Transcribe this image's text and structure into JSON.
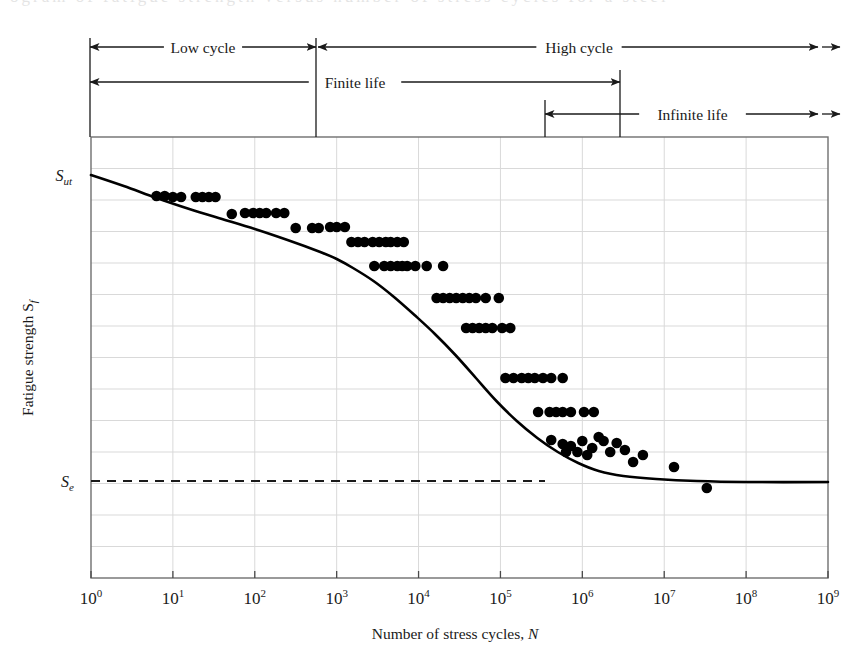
{
  "figure": {
    "partial_top_text": "ogram of fatigue strength versus number of stress cycles for a steel",
    "background": "#ffffff",
    "ink_color": "#1a1a1a",
    "grid_color": "#d9d9d9"
  },
  "annotations": {
    "rows": [
      {
        "id": "low-cycle",
        "label": "Low cycle",
        "x1": 90,
        "x2": 316,
        "y": 47,
        "left_arrow": true,
        "right_arrow": true,
        "double_right": false
      },
      {
        "id": "high-cycle",
        "label": "High cycle",
        "x1": 318,
        "x2": 840,
        "y": 47,
        "left_arrow": true,
        "right_arrow": true,
        "double_right": true
      },
      {
        "id": "finite-life",
        "label": "Finite life",
        "x1": 90,
        "x2": 620,
        "y": 82,
        "left_arrow": true,
        "right_arrow": true,
        "double_right": false
      },
      {
        "id": "infinite-life",
        "label": "Infinite life",
        "x1": 545,
        "x2": 840,
        "y": 114,
        "left_arrow": true,
        "right_arrow": true,
        "double_right": true
      }
    ],
    "verticals": [
      {
        "id": "tick-left-edge",
        "x": 90,
        "y1": 38,
        "y2": 137
      },
      {
        "id": "tick-1e3",
        "x": 316,
        "y1": 38,
        "y2": 137
      },
      {
        "id": "tick-1e7-finite",
        "x": 620,
        "y1": 70,
        "y2": 137
      },
      {
        "id": "tick-1e6-infinite",
        "x": 545,
        "y1": 100,
        "y2": 137
      }
    ]
  },
  "axes": {
    "x_title": "Number of stress cycles, N",
    "x_title_italic_tail": "N",
    "y_title": "Fatigue strength S",
    "y_title_sub": "f",
    "x_ticks": [
      {
        "base": "10",
        "exp": "0",
        "value": 1
      },
      {
        "base": "10",
        "exp": "1",
        "value": 10
      },
      {
        "base": "10",
        "exp": "2",
        "value": 100
      },
      {
        "base": "10",
        "exp": "3",
        "value": 1000
      },
      {
        "base": "10",
        "exp": "4",
        "value": 10000
      },
      {
        "base": "10",
        "exp": "5",
        "value": 100000
      },
      {
        "base": "10",
        "exp": "6",
        "value": 1000000
      },
      {
        "base": "10",
        "exp": "7",
        "value": 10000000
      },
      {
        "base": "10",
        "exp": "8",
        "value": 100000000
      },
      {
        "base": "10",
        "exp": "9",
        "value": 1000000000
      }
    ],
    "y_markers": [
      {
        "id": "sut",
        "base": "S",
        "sub": "ut",
        "y": 175,
        "label_x": 72
      },
      {
        "id": "se",
        "base": "S",
        "sub": "e",
        "y": 481,
        "label_x": 74
      }
    ],
    "plot_box": {
      "left": 91,
      "top": 137,
      "right": 828,
      "bottom": 578
    },
    "grid_horizontal_count": 13,
    "grid_vertical_decades": 9
  },
  "reference_lines": {
    "endurance_limit": {
      "id": "se-dashed-line",
      "y": 481,
      "x1": 91,
      "x2": 545,
      "dash": "9 7"
    }
  },
  "chart_data": {
    "type": "scatter",
    "title": "",
    "xlabel": "Number of stress cycles, N",
    "ylabel": "Fatigue strength S_f",
    "xscale": "log",
    "xlim": [
      1,
      1000000000
    ],
    "ylim_labels": [
      "S_e",
      "S_ut"
    ],
    "grid": true,
    "legend": "none",
    "series": [
      {
        "name": "S-N curve (fitted)",
        "type": "line",
        "comment": "Fatigue strength curve; knee near 1e6 cycles flattening to endurance limit S_e",
        "points_log10N_vs_pixelY": [
          [
            0.0,
            175
          ],
          [
            0.4,
            186
          ],
          [
            0.8,
            198
          ],
          [
            1.2,
            209
          ],
          [
            1.6,
            219
          ],
          [
            2.0,
            229
          ],
          [
            2.4,
            240
          ],
          [
            2.8,
            252
          ],
          [
            3.0,
            259
          ],
          [
            3.2,
            268
          ],
          [
            3.45,
            281
          ],
          [
            3.7,
            297
          ],
          [
            3.95,
            315
          ],
          [
            4.2,
            334
          ],
          [
            4.45,
            355
          ],
          [
            4.7,
            378
          ],
          [
            4.95,
            401
          ],
          [
            5.2,
            421
          ],
          [
            5.45,
            438
          ],
          [
            5.7,
            452
          ],
          [
            5.95,
            463
          ],
          [
            6.2,
            471
          ],
          [
            6.5,
            476
          ],
          [
            6.9,
            479
          ],
          [
            7.4,
            481
          ],
          [
            8.0,
            482
          ],
          [
            9.0,
            482
          ]
        ]
      },
      {
        "name": "test data points",
        "type": "scatter",
        "points_log10N_vs_pixelY": [
          [
            0.8,
            196
          ],
          [
            0.9,
            196
          ],
          [
            1.0,
            197
          ],
          [
            1.1,
            197
          ],
          [
            1.28,
            197
          ],
          [
            1.36,
            197
          ],
          [
            1.44,
            197
          ],
          [
            1.52,
            197
          ],
          [
            1.72,
            214
          ],
          [
            1.88,
            213
          ],
          [
            1.98,
            213
          ],
          [
            2.06,
            213
          ],
          [
            2.14,
            213
          ],
          [
            2.26,
            213
          ],
          [
            2.36,
            213
          ],
          [
            2.5,
            228
          ],
          [
            2.7,
            228
          ],
          [
            2.78,
            228
          ],
          [
            2.92,
            227
          ],
          [
            3.0,
            227
          ],
          [
            3.1,
            227
          ],
          [
            3.18,
            242
          ],
          [
            3.26,
            242
          ],
          [
            3.34,
            242
          ],
          [
            3.44,
            242
          ],
          [
            3.52,
            242
          ],
          [
            3.6,
            242
          ],
          [
            3.66,
            242
          ],
          [
            3.74,
            242
          ],
          [
            3.82,
            242
          ],
          [
            3.46,
            266
          ],
          [
            3.58,
            266
          ],
          [
            3.66,
            266
          ],
          [
            3.74,
            266
          ],
          [
            3.8,
            266
          ],
          [
            3.86,
            266
          ],
          [
            3.96,
            266
          ],
          [
            4.1,
            266
          ],
          [
            4.3,
            266
          ],
          [
            4.22,
            298
          ],
          [
            4.3,
            298
          ],
          [
            4.38,
            298
          ],
          [
            4.46,
            298
          ],
          [
            4.54,
            298
          ],
          [
            4.62,
            298
          ],
          [
            4.7,
            298
          ],
          [
            4.82,
            298
          ],
          [
            4.98,
            298
          ],
          [
            4.58,
            328
          ],
          [
            4.66,
            328
          ],
          [
            4.74,
            328
          ],
          [
            4.82,
            328
          ],
          [
            4.9,
            328
          ],
          [
            5.02,
            328
          ],
          [
            5.12,
            328
          ],
          [
            5.06,
            378
          ],
          [
            5.16,
            378
          ],
          [
            5.26,
            378
          ],
          [
            5.34,
            378
          ],
          [
            5.42,
            378
          ],
          [
            5.52,
            378
          ],
          [
            5.62,
            378
          ],
          [
            5.76,
            378
          ],
          [
            5.46,
            412
          ],
          [
            5.6,
            412
          ],
          [
            5.68,
            412
          ],
          [
            5.76,
            412
          ],
          [
            5.86,
            412
          ],
          [
            6.02,
            412
          ],
          [
            6.14,
            412
          ],
          [
            5.62,
            440
          ],
          [
            5.76,
            444
          ],
          [
            5.8,
            452
          ],
          [
            5.86,
            446
          ],
          [
            5.94,
            452
          ],
          [
            6.0,
            441
          ],
          [
            6.06,
            455
          ],
          [
            6.12,
            448
          ],
          [
            6.2,
            437
          ],
          [
            6.26,
            441
          ],
          [
            6.34,
            452
          ],
          [
            6.42,
            443
          ],
          [
            6.52,
            450
          ],
          [
            6.62,
            462
          ],
          [
            6.74,
            455
          ],
          [
            7.12,
            467
          ],
          [
            7.52,
            488
          ]
        ]
      }
    ]
  }
}
